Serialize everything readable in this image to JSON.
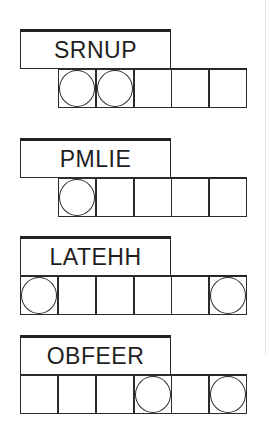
{
  "game": "Jumble word puzzle",
  "puzzles": [
    {
      "scrambled": "SRNUP",
      "top": 29,
      "cells": [
        {
          "col": 1,
          "circled": true
        },
        {
          "col": 2,
          "circled": true
        },
        {
          "col": 3,
          "circled": false
        },
        {
          "col": 4,
          "circled": false
        },
        {
          "col": 5,
          "circled": false
        }
      ]
    },
    {
      "scrambled": "PMLIE",
      "top": 138,
      "cells": [
        {
          "col": 1,
          "circled": true
        },
        {
          "col": 2,
          "circled": false
        },
        {
          "col": 3,
          "circled": false
        },
        {
          "col": 4,
          "circled": false
        },
        {
          "col": 5,
          "circled": false
        }
      ]
    },
    {
      "scrambled": "LATEHH",
      "top": 236,
      "cells": [
        {
          "col": 0,
          "circled": true
        },
        {
          "col": 1,
          "circled": false
        },
        {
          "col": 2,
          "circled": false
        },
        {
          "col": 3,
          "circled": false
        },
        {
          "col": 4,
          "circled": false
        },
        {
          "col": 5,
          "circled": true
        }
      ]
    },
    {
      "scrambled": "OBFEER",
      "top": 335,
      "cells": [
        {
          "col": 0,
          "circled": false
        },
        {
          "col": 1,
          "circled": false
        },
        {
          "col": 2,
          "circled": false
        },
        {
          "col": 3,
          "circled": true
        },
        {
          "col": 4,
          "circled": false
        },
        {
          "col": 5,
          "circled": true
        }
      ]
    }
  ]
}
